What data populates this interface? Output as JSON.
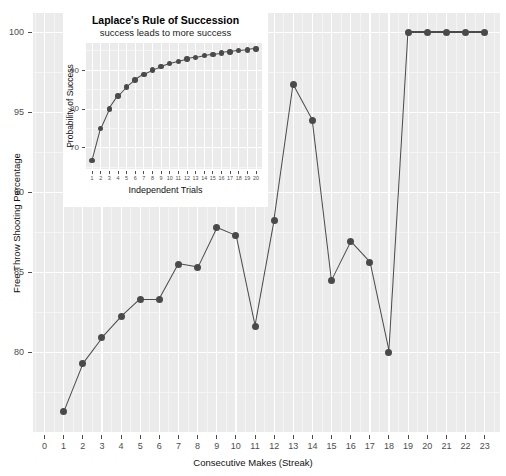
{
  "chart_data": [
    {
      "id": "main",
      "type": "line",
      "title": "",
      "xlabel": "Consecutive Makes (Streak)",
      "ylabel": "Free Throw Shooting Percentage",
      "xlim": [
        -0.6,
        23.8
      ],
      "ylim": [
        75.0,
        101.2
      ],
      "xticks": [
        0,
        1,
        2,
        3,
        4,
        5,
        6,
        7,
        8,
        9,
        10,
        11,
        12,
        13,
        14,
        15,
        16,
        17,
        18,
        19,
        20,
        21,
        22,
        23
      ],
      "xticklabels": [
        "0",
        "1",
        "2",
        "3",
        "4",
        "5",
        "6",
        "7",
        "8",
        "9",
        "10",
        "11",
        "12",
        "13",
        "14",
        "15",
        "16",
        "17",
        "18",
        "19",
        "20",
        "21",
        "22",
        "23"
      ],
      "yticks": [
        80,
        85,
        90,
        95,
        100
      ],
      "yticklabels": [
        "80",
        "85",
        "90",
        "95",
        "100"
      ],
      "grid": true,
      "legend": "none",
      "marker": "circle",
      "series": [
        {
          "name": "Free Throw Shooting Percentage by Streak",
          "color": "#4a4a4a",
          "x": [
            1,
            2,
            3,
            4,
            5,
            6,
            7,
            8,
            9,
            10,
            11,
            12,
            13,
            14,
            15,
            16,
            17,
            18,
            19,
            20,
            21,
            22,
            23
          ],
          "values": [
            76.3,
            79.3,
            80.9,
            82.2,
            83.3,
            83.3,
            85.5,
            85.3,
            87.8,
            87.3,
            81.6,
            88.2,
            96.7,
            94.5,
            84.5,
            86.9,
            85.6,
            80.0,
            100.0,
            100.0,
            100.0,
            100.0,
            100.0
          ]
        }
      ]
    },
    {
      "id": "inset",
      "type": "line",
      "title": "Laplace's Rule of Succession",
      "subtitle": "success leads to more success",
      "xlabel": "Independent Trials",
      "ylabel": "Probability of Success",
      "xlim": [
        0.3,
        20.7
      ],
      "ylim": [
        64.5,
        97.0
      ],
      "xticks": [
        1,
        2,
        3,
        4,
        5,
        6,
        7,
        8,
        9,
        10,
        11,
        12,
        13,
        14,
        15,
        16,
        17,
        18,
        19,
        20
      ],
      "xticklabels": [
        "1",
        "2",
        "3",
        "4",
        "5",
        "6",
        "7",
        "8",
        "9",
        "10",
        "11",
        "12",
        "13",
        "14",
        "15",
        "16",
        "17",
        "18",
        "19",
        "20"
      ],
      "yticks": [
        70,
        80,
        90
      ],
      "yticklabels": [
        "70",
        "80",
        "90"
      ],
      "grid": true,
      "legend": "none",
      "marker": "circle",
      "series": [
        {
          "name": "Laplace (n+1)/(n+2)",
          "color": "#4a4a4a",
          "x": [
            1,
            2,
            3,
            4,
            5,
            6,
            7,
            8,
            9,
            10,
            11,
            12,
            13,
            14,
            15,
            16,
            17,
            18,
            19,
            20
          ],
          "values": [
            66.7,
            75.0,
            80.0,
            83.3,
            85.7,
            87.5,
            88.9,
            90.0,
            90.9,
            91.7,
            92.3,
            92.9,
            93.3,
            93.8,
            94.1,
            94.4,
            94.7,
            95.0,
            95.2,
            95.5
          ]
        }
      ]
    }
  ],
  "style": {
    "panel_bg": "#ebebeb",
    "grid_major": "#ffffff",
    "grid_minor": "#f5f5f5",
    "marker_color": "#4a4a4a",
    "line_color": "#4a4a4a",
    "tick_text": "#4d4d4d",
    "axis_title": "#111111",
    "inset_card_bg": "#ffffff"
  }
}
